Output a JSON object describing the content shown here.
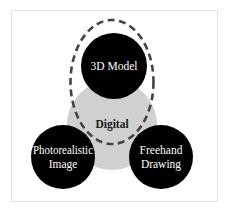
{
  "diagram": {
    "type": "venn",
    "nodes": [
      {
        "id": "digital",
        "label": "Digital",
        "lines": [
          "Digital"
        ],
        "fill": "#d0d0d0",
        "text_color": "#1a1a1a"
      },
      {
        "id": "3d-model",
        "label": "3D Model",
        "lines": [
          "3D Model"
        ],
        "fill": "#000000",
        "text_color": "#ffffff"
      },
      {
        "id": "photorealistic-image",
        "label": "Photorealistic Image",
        "lines": [
          "Photorealistic",
          "Image"
        ],
        "fill": "#000000",
        "text_color": "#ffffff"
      },
      {
        "id": "freehand-drawing",
        "label": "Freehand Drawing",
        "lines": [
          "Freehand",
          "Drawing"
        ],
        "fill": "#000000",
        "text_color": "#ffffff"
      }
    ],
    "highlight": {
      "shape": "dashed-ellipse",
      "encloses": [
        "3d-model",
        "digital"
      ],
      "stroke": "#444444"
    },
    "border_color": "#e2e2e2"
  }
}
